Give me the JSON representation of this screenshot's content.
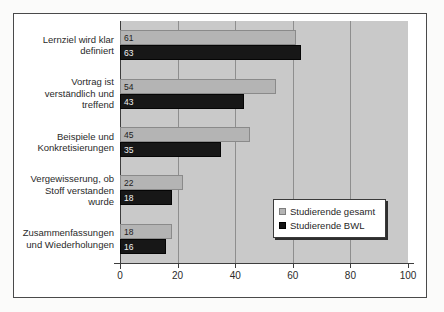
{
  "chart_data": {
    "type": "bar",
    "orientation": "horizontal",
    "title": "",
    "xlabel": "",
    "ylabel": "",
    "xlim": [
      0,
      100
    ],
    "xticks": [
      "0",
      "20",
      "40",
      "60",
      "80",
      "100"
    ],
    "grid": true,
    "legend_position": "inside-lower-right",
    "categories": [
      "Lernziel wird klar definiert",
      "Vortrag ist verständlich und treffend",
      "Beispiele und Konkretisierungen",
      "Vergewisserung, ob Stoff verstanden wurde",
      "Zusammenfassungen und Wiederholungen"
    ],
    "category_lines": [
      [
        "Lernziel wird klar",
        "definiert"
      ],
      [
        "Vortrag ist",
        "verständlich und",
        "treffend"
      ],
      [
        "Beispiele und",
        "Konkretisierungen"
      ],
      [
        "Vergewisserung, ob",
        "Stoff verstanden",
        "wurde"
      ],
      [
        "Zusammenfassungen",
        "und Wiederholungen"
      ]
    ],
    "series": [
      {
        "name": "Studierende gesamt",
        "color": "#b4b4b4",
        "values": [
          61,
          54,
          45,
          22,
          18
        ]
      },
      {
        "name": "Studierende BWL",
        "color": "#141414",
        "values": [
          63,
          43,
          35,
          18,
          16
        ]
      }
    ]
  },
  "legend": {
    "items": [
      {
        "label": "Studierende gesamt"
      },
      {
        "label": "Studierende BWL"
      }
    ]
  },
  "colors": {
    "plot_background": "#c9c9c9",
    "gridline": "#8e8e8e",
    "axis": "#3d3d3d",
    "series_total": "#b4b4b4",
    "series_bwl": "#141414",
    "frame_border": "#4a4a4a"
  }
}
